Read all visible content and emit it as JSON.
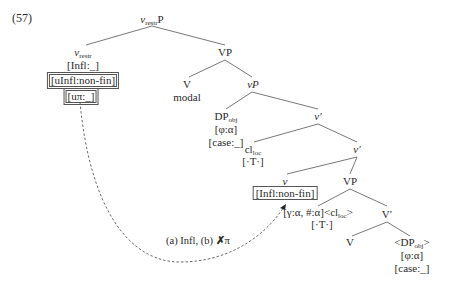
{
  "example_number": "(57)",
  "nodes": {
    "root": {
      "head": "v",
      "sub": "restr",
      "tail": "P"
    },
    "vrestr": {
      "head": "v",
      "sub": "restr",
      "features": [
        "[Infl:_]",
        "[uInfl:non-fin]",
        "[uπ:_]"
      ]
    },
    "vp_top": {
      "label": "VP"
    },
    "v_modal": {
      "label": "V",
      "gloss": "modal"
    },
    "little_vp": {
      "label": "vP"
    },
    "dp_obj": {
      "head": "DP",
      "sub": "obj",
      "features": [
        "[φ:α]",
        "[case:_]"
      ]
    },
    "vbar1": {
      "label": "v′"
    },
    "cl_loc": {
      "head": "cl",
      "sub": "loc",
      "features": [
        "[·T·]"
      ]
    },
    "vbar2": {
      "label": "v′"
    },
    "little_v": {
      "label": "v",
      "boxed_feature": "[Infl:non-fin]",
      "agree": "[γ:α, #:α]<cl",
      "agree_sub": "loc",
      "agree_close": ">",
      "agree_feature": "[·T·]"
    },
    "vp_low": {
      "label": "VP"
    },
    "vbar_low": {
      "label": "V′"
    },
    "v_low": {
      "label": "V"
    },
    "dp_obj_trace": {
      "head": "<DP",
      "sub": "obj",
      "tail": ">",
      "features": [
        "[φ:α]",
        "[case:_]"
      ]
    }
  },
  "arrow_note": {
    "text_a": "(a) Infl, (b) ",
    "cross": "✗",
    "pi": "π"
  }
}
